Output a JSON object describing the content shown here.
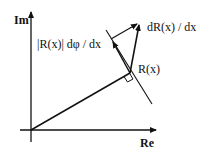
{
  "diagram": {
    "type": "complex-plane vector diagram",
    "axes": {
      "x_label": "Re",
      "y_label": "Im"
    },
    "labels": {
      "point": "R(x)",
      "derivative": "dR(x) / dx",
      "phase_component": "|R(x)| dφ / dx"
    },
    "colors": {
      "ink": "#111111",
      "background": "#ffffff"
    }
  }
}
